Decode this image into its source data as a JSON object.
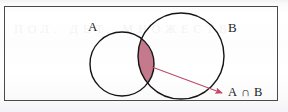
{
  "figure": {
    "kind": "venn-diagram",
    "caption_ghost": "ПОЛ. ДЕТ. МНОЖЕСТВ",
    "frame": {
      "border_color": "#4a4a4a",
      "background_color": "#fdfdfd"
    },
    "sets": [
      {
        "id": "A",
        "label": "A",
        "label_x": 88,
        "label_y": 20,
        "cx": 122,
        "cy": 64,
        "r": 32,
        "stroke": "#151515",
        "stroke_width": 1.4,
        "fill": "none"
      },
      {
        "id": "B",
        "label": "B",
        "label_x": 228,
        "label_y": 21,
        "cx": 181,
        "cy": 56,
        "r": 43,
        "stroke": "#151515",
        "stroke_width": 1.4,
        "fill": "none"
      }
    ],
    "intersection": {
      "label": "A ∩ B",
      "fill_color": "#c47a8c",
      "stroke_color": "#8f4a5c",
      "label_x": 228,
      "label_y": 86
    },
    "annotation_arrow": {
      "color": "#bf4a68",
      "stroke_width": 1.1,
      "from_x": 152,
      "from_y": 67,
      "to_x": 222,
      "to_y": 93,
      "head_length": 8,
      "head_width": 5
    },
    "colors": {
      "ink": "#151515",
      "rose_fill": "#c47a8c",
      "rose_line": "#bf4a68",
      "frame_line": "#4a4a4a",
      "paper": "#fdfdfd"
    }
  }
}
